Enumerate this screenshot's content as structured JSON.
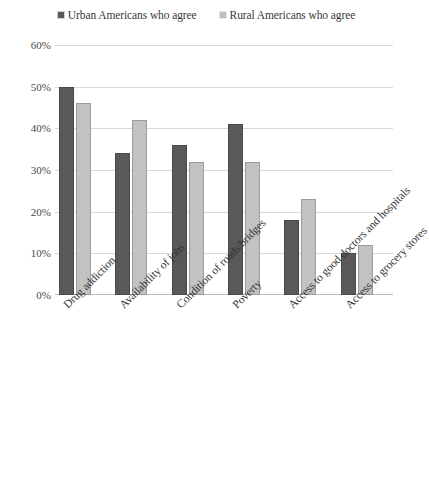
{
  "chart_data": {
    "type": "bar",
    "title": "",
    "xlabel": "",
    "ylabel": "",
    "ylim": [
      0,
      60
    ],
    "ytick_labels": [
      "0%",
      "10%",
      "20%",
      "30%",
      "40%",
      "50%",
      "60%"
    ],
    "ytick_values": [
      0,
      10,
      20,
      30,
      40,
      50,
      60
    ],
    "grid": true,
    "legend_position": "top-center",
    "categories": [
      "Drug addiction",
      "Availability of jobs",
      "Condition of roads/bridges",
      "Poverty",
      "Access to good doctors and hospitals",
      "Access to grocery stores"
    ],
    "series": [
      {
        "name": "Urban Americans who agree",
        "color": "#595959",
        "values": [
          50,
          34,
          36,
          41,
          18,
          10
        ]
      },
      {
        "name": "Rural Americans who agree",
        "color": "#c2c2c2",
        "values": [
          46,
          42,
          32,
          32,
          23,
          12
        ]
      }
    ]
  },
  "legend": {
    "items": [
      {
        "label": "Urban Americans who agree",
        "swatch": "urban-swatch-icon"
      },
      {
        "label": "Rural Americans who agree",
        "swatch": "rural-swatch-icon"
      }
    ]
  },
  "axis": {
    "y_labels": [
      "60%",
      "50%",
      "40%",
      "30%",
      "20%",
      "10%",
      "0%"
    ]
  }
}
